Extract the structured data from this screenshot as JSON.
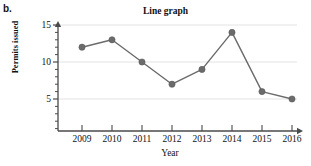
{
  "figure": {
    "part_label": "b.",
    "title": "Line graph"
  },
  "chart_data": {
    "type": "line",
    "title": "Line graph",
    "xlabel": "Year",
    "ylabel": "Permits issued",
    "categories": [
      "2009",
      "2010",
      "2011",
      "2012",
      "2013",
      "2014",
      "2015",
      "2016"
    ],
    "values": [
      12,
      13,
      10,
      7,
      9,
      14,
      6,
      5
    ],
    "x": [
      2009,
      2010,
      2011,
      2012,
      2013,
      2014,
      2015,
      2016
    ],
    "series": [
      {
        "name": "Permits issued",
        "values": [
          12,
          13,
          10,
          7,
          9,
          14,
          6,
          5
        ]
      }
    ],
    "ylim": [
      0,
      15.5
    ],
    "xlim": [
      2008.5,
      2016.5
    ],
    "y_ticks_major": [
      5,
      10,
      15
    ],
    "y_tick_labels": [
      "5",
      "10",
      "15"
    ],
    "y_minor_tick_step": 1,
    "grid": "horizontal",
    "legend": "none",
    "line_color": "#6b6b6b",
    "marker_color": "#6b6b6b",
    "marker": "circle",
    "gridline_color": "#e3e3e3",
    "axis_color": "#4a4a4a",
    "axis_style": "arrow-tipped-L"
  }
}
